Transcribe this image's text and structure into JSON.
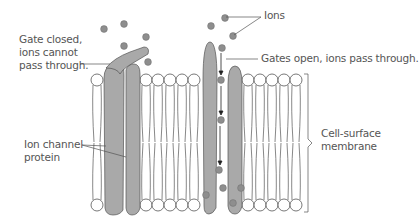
{
  "labels": {
    "gate_closed": "Gate closed,\nions cannot\npass through.",
    "ions": "Ions",
    "gates_open": "Gates open, ions pass through.",
    "cell_surface_membrane": "Cell-surface\nmembrane",
    "ion_channel_protein": "Ion channel\nprotein"
  },
  "colors": {
    "protein_fill": "#a9a9a9",
    "ion_fill": "#8e8e8e",
    "outline": "#555555",
    "text": "#555555",
    "background": "#ffffff"
  },
  "membrane": {
    "top_head_y": 80,
    "bottom_head_y": 205,
    "head_radius": 6,
    "left_heads_x": [
      97
    ],
    "middle_heads_x": [
      146,
      158,
      170,
      182,
      194
    ],
    "right_heads_x": [
      248,
      260,
      272,
      284,
      296
    ]
  },
  "ions": {
    "above": [
      [
        104,
        29
      ],
      [
        124,
        24
      ],
      [
        146,
        37
      ],
      [
        124,
        46
      ],
      [
        148,
        62
      ],
      [
        225,
        18
      ],
      [
        211,
        26
      ],
      [
        233,
        36
      ],
      [
        222,
        48
      ]
    ],
    "in_channel": [
      [
        221,
        80
      ],
      [
        221,
        120
      ],
      [
        219,
        170
      ]
    ],
    "below": [
      [
        206,
        195
      ],
      [
        223,
        188
      ],
      [
        241,
        188
      ],
      [
        233,
        203
      ]
    ]
  }
}
